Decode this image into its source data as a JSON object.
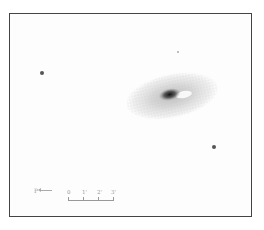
{
  "sketch": {
    "subject": "galaxy",
    "frame": {
      "border_color": "#444444",
      "background": "#fdfdfd"
    },
    "galaxy": {
      "core_x": 170,
      "core_y": 92,
      "rx": 47,
      "ry": 22,
      "tilt_deg": -12
    },
    "stars": [
      {
        "x": 42,
        "y": 73,
        "r": 2
      },
      {
        "x": 214,
        "y": 147,
        "r": 1.8
      },
      {
        "x": 178,
        "y": 52,
        "r": 0.8
      }
    ],
    "direction_indicator": {
      "label": "P",
      "arrow": "←"
    },
    "scale_bar": {
      "ticks": [
        "0",
        "1'",
        "2'",
        "3'"
      ]
    }
  }
}
